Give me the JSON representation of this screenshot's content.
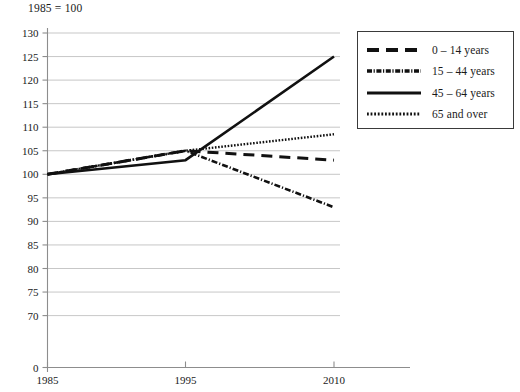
{
  "chart_data": {
    "type": "line",
    "title": "1985 = 100",
    "xlabel": "",
    "ylabel": "",
    "x": [
      1985,
      1995,
      2010
    ],
    "xtick_labels": [
      "1985",
      "1995",
      "2010"
    ],
    "ytick_labels": [
      "130",
      "125",
      "120",
      "115",
      "110",
      "105",
      "100",
      "95",
      "90",
      "85",
      "80",
      "75",
      "70",
      "0"
    ],
    "ytick_values": [
      130,
      125,
      120,
      115,
      110,
      105,
      100,
      95,
      90,
      85,
      80,
      75,
      70,
      0
    ],
    "ylim": [
      70,
      130
    ],
    "axis_break": true,
    "grid": true,
    "legend_position": "top-right",
    "series": [
      {
        "name": "0 – 14 years",
        "style": "dashed",
        "values": [
          100,
          105,
          103
        ]
      },
      {
        "name": "15 – 44 years",
        "style": "dash-dot",
        "values": [
          100,
          105,
          93
        ]
      },
      {
        "name": "45 – 64 years",
        "style": "solid",
        "values": [
          100,
          103,
          125
        ]
      },
      {
        "name": "65 and over",
        "style": "dotted",
        "values": [
          100,
          105,
          108.5
        ]
      }
    ]
  },
  "legend": {
    "items": [
      {
        "label": "0 – 14 years"
      },
      {
        "label": "15 – 44 years"
      },
      {
        "label": "45 – 64 years"
      },
      {
        "label": "65 and over"
      }
    ]
  },
  "axes": {
    "y_ticks": [
      {
        "label": "130"
      },
      {
        "label": "125"
      },
      {
        "label": "120"
      },
      {
        "label": "115"
      },
      {
        "label": "110"
      },
      {
        "label": "105"
      },
      {
        "label": "100"
      },
      {
        "label": "95"
      },
      {
        "label": "90"
      },
      {
        "label": "85"
      },
      {
        "label": "80"
      },
      {
        "label": "75"
      },
      {
        "label": "70"
      },
      {
        "label": "0"
      }
    ],
    "x_ticks": [
      {
        "label": "1985"
      },
      {
        "label": "1995"
      },
      {
        "label": "2010"
      }
    ]
  },
  "colors": {
    "line": "#111111",
    "grid": "#b9b9b9",
    "axis": "#8d8d8d",
    "text": "#1a1a1a",
    "legend_border": "#3a3a3a",
    "background": "#ffffff"
  }
}
